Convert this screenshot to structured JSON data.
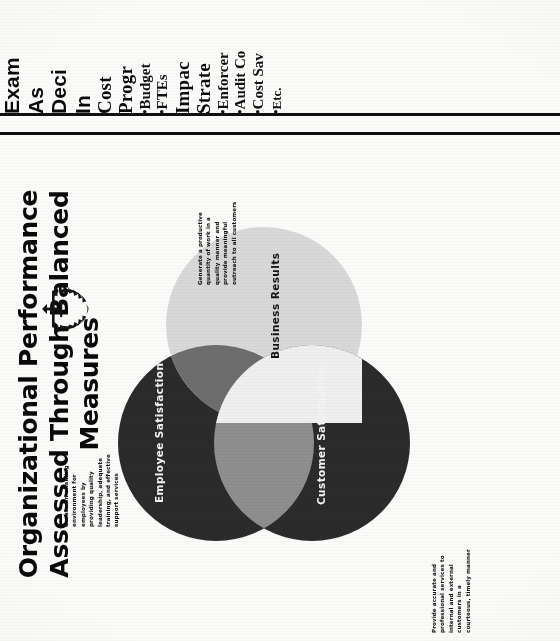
{
  "document": {
    "kind": "scanned-presentation-slide",
    "orientation": "rotated-90-ccw"
  },
  "top_slide": {
    "title_lines": [
      "Exam",
      "As",
      "Deci",
      "In"
    ],
    "title_full_visible": "Exam... As... Deci... In...",
    "columns": [
      {
        "heading_lines": [
          "Cost",
          "Progr"
        ],
        "bullets": [
          "Budget",
          "FTEs"
        ]
      },
      {
        "heading_lines": [
          "Impac",
          "Strate"
        ],
        "bullets": [
          "Enforcer",
          "Audit Co",
          "Cost Sav",
          "Etc."
        ]
      }
    ],
    "bullet_marker": "•"
  },
  "main_slide": {
    "title": "Organizational Performance Assessed Through Balanced Measures",
    "venn": {
      "circles": [
        {
          "id": "employee",
          "label": "Employee  Satisfaction",
          "color": "#2b2b2b",
          "label_color": "#f4f4f4",
          "note": "Create an enabling environment for employees by providing quality leadership, adequate training, and effective support services"
        },
        {
          "id": "customer",
          "label": "Customer  Satisfaction",
          "color": "#2b2b2b",
          "label_color": "#f4f4f4",
          "note": "Provide accurate and professional services to internal and external customers in a courteous, timely manner"
        },
        {
          "id": "business",
          "label": "Business  Results",
          "color": "#d8d8d8",
          "label_color": "#141414",
          "note": "Generate a productive quantity of work in a quality manner and provide meaningful outreach to all customers"
        }
      ],
      "overlap_colors": {
        "employee_customer": "#8e8e8e",
        "employee_business": "#6d6d6d",
        "customer_business": "#565656",
        "all_three": "#efefef"
      }
    },
    "logo": {
      "name": "irs-seal",
      "alt": "Internal Revenue Service eagle and scales seal"
    }
  }
}
